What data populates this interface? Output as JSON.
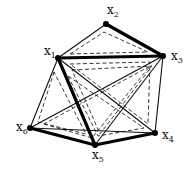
{
  "diagram": {
    "type": "graph",
    "vertices": [
      {
        "id": "x1",
        "label": "x",
        "sub": "1",
        "x": 58,
        "y": 58,
        "lx": 44,
        "ly": 55
      },
      {
        "id": "x2",
        "label": "x",
        "sub": "2",
        "x": 106,
        "y": 24,
        "lx": 107,
        "ly": 14
      },
      {
        "id": "x3",
        "label": "x",
        "sub": "3",
        "x": 163,
        "y": 56,
        "lx": 171,
        "ly": 60
      },
      {
        "id": "x4",
        "label": "x",
        "sub": "4",
        "x": 155,
        "y": 133,
        "lx": 162,
        "ly": 139
      },
      {
        "id": "x5",
        "label": "x",
        "sub": "5",
        "x": 95,
        "y": 145,
        "lx": 92,
        "ly": 159
      },
      {
        "id": "x6",
        "label": "x",
        "sub": "6",
        "x": 30,
        "y": 128,
        "lx": 16,
        "ly": 131
      }
    ],
    "bold_edges": [
      [
        "x2",
        "x3"
      ],
      [
        "x1",
        "x3"
      ],
      [
        "x1",
        "x5"
      ],
      [
        "x6",
        "x5"
      ],
      [
        "x5",
        "x4"
      ]
    ],
    "thin_edges": [
      [
        "x1",
        "x2"
      ],
      [
        "x1",
        "x6"
      ],
      [
        "x1",
        "x4"
      ],
      [
        "x3",
        "x6"
      ],
      [
        "x3",
        "x5"
      ],
      [
        "x3",
        "x4"
      ],
      [
        "x6",
        "x4"
      ]
    ],
    "dashed_loops": [
      {
        "name": "loop-x1-x2-x3",
        "points": [
          [
            70,
            54
          ],
          [
            104,
            32
          ],
          [
            148,
            52
          ]
        ]
      },
      {
        "name": "loop-x1-x3-x4",
        "points": [
          [
            70,
            64
          ],
          [
            150,
            62
          ],
          [
            148,
            124
          ]
        ]
      },
      {
        "name": "loop-x1-x6-x5",
        "points": [
          [
            54,
            72
          ],
          [
            38,
            122
          ],
          [
            86,
            134
          ]
        ]
      },
      {
        "name": "loop-x1-x5-x4",
        "points": [
          [
            68,
            76
          ],
          [
            98,
            136
          ],
          [
            144,
            128
          ]
        ]
      },
      {
        "name": "loop-x6-x5-x3",
        "points": [
          [
            44,
            124
          ],
          [
            92,
            138
          ],
          [
            150,
            66
          ]
        ]
      },
      {
        "name": "loop-x1-x3-x5",
        "points": [
          [
            72,
            70
          ],
          [
            152,
            66
          ],
          [
            100,
            134
          ]
        ]
      }
    ]
  }
}
